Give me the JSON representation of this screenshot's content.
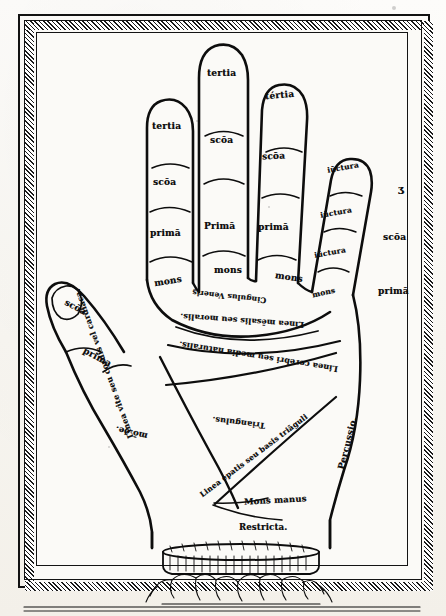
{
  "figure": {
    "kind": "chiromancy-hand-diagram",
    "ink_color": "#0d0d0d",
    "paper_color": "#fbfaf7"
  },
  "fingers": {
    "index": {
      "name": "index-finger",
      "segments": [
        "tertia",
        "scōa",
        "primā"
      ],
      "mount": "mons"
    },
    "middle": {
      "name": "middle-finger",
      "segments": [
        "tertia",
        "scōa",
        "Primā"
      ],
      "mount": "mons"
    },
    "ring": {
      "name": "ring-finger",
      "segments": [
        "tértia",
        "scōa",
        "primā"
      ],
      "mount": "mons"
    },
    "little": {
      "name": "little-finger",
      "segments": [
        "iūctura",
        "iūctura",
        "iūctura"
      ],
      "mount": "mons",
      "outer_labels": [
        "ʒ",
        "scōa",
        "primā"
      ]
    },
    "thumb": {
      "name": "thumb",
      "segments": [
        "scōa",
        "prima"
      ]
    }
  },
  "palm_labels": {
    "girdle_of_venus": "Cingulus Veneris̤",
    "mensal_line": "Linea mēsalis seu moralis.",
    "cerebral_line": "Linea cerebri seu media naturalis.",
    "life_line": "Linea vite seu cordis vel cardiaca.",
    "triangle": "Triangulus.",
    "hepatic_line": "Linea epatis seu basis triāguli",
    "mount_of_venus": "mō.ðe.",
    "percussio": "Percussio.",
    "mons_manus": "Mons manus",
    "restricta": "Restricta."
  },
  "ornament": {
    "name": "wrist-cuff-ornament",
    "description": "fringed cuff band with foliate scrollwork at the wrist"
  }
}
